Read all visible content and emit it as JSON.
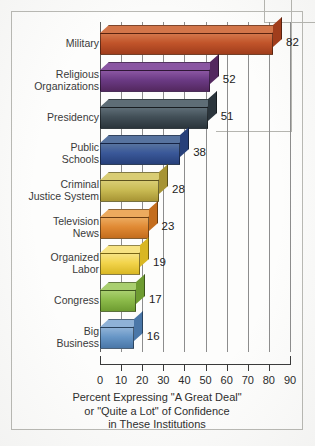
{
  "chart_data": {
    "type": "bar",
    "orientation": "horizontal",
    "title": "",
    "caption_lines": [
      "Percent Expressing \"A Great Deal\"",
      "or \"Quite a Lot\" of Confidence",
      "in These Institutions"
    ],
    "xlabel": "",
    "ylabel": "",
    "xlim": [
      0,
      90
    ],
    "xticks": [
      0,
      10,
      20,
      30,
      40,
      50,
      60,
      70,
      80,
      90
    ],
    "xtick_labels": [
      "0",
      "10",
      "20",
      "30",
      "40",
      "50",
      "60",
      "70",
      "80",
      "90"
    ],
    "grid": true,
    "grid_axis": "x",
    "legend": "none",
    "categories": [
      "Military",
      "Religious\nOrganizations",
      "Presidency",
      "Public\nSchools",
      "Criminal\nJustice System",
      "Television\nNews",
      "Organized\nLabor",
      "Congress",
      "Big\nBusiness"
    ],
    "values": [
      82,
      52,
      51,
      38,
      28,
      23,
      19,
      17,
      16
    ],
    "value_labels": [
      "82",
      "52",
      "51",
      "38",
      "28",
      "23",
      "19",
      "17",
      "16"
    ],
    "bar_colors": [
      "#c1542a",
      "#6b3a84",
      "#424f57",
      "#3a5899",
      "#c9bb53",
      "#e08a34",
      "#f2d44b",
      "#8cbb4a",
      "#6796c6"
    ],
    "bar_top_colors": [
      "#d3764a",
      "#8a56a2",
      "#5e6d76",
      "#57739f",
      "#d9cd74",
      "#ecaa5e",
      "#f7e383",
      "#a9cf6f",
      "#8fb2d7"
    ],
    "bar_side_colors": [
      "#a03d1c",
      "#53285f",
      "#2b353c",
      "#27407a",
      "#a79434",
      "#c46d1d",
      "#d9b723",
      "#6e9c31",
      "#4a77a8"
    ]
  }
}
